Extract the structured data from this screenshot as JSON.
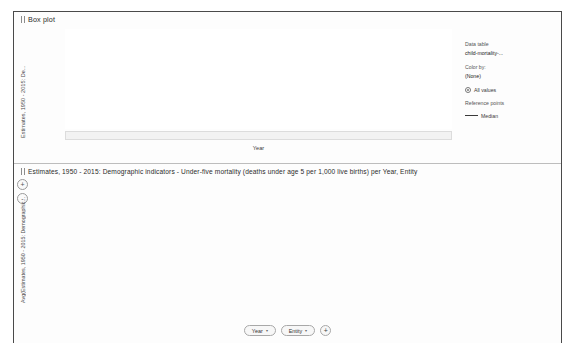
{
  "boxplot": {
    "panel_title": "Box plot",
    "y_axis_label": "Estimates, 1950 - 2015: De...",
    "x_axis_title": "Year",
    "y_ticks": [
      450,
      400,
      350,
      300,
      250,
      200,
      150,
      100,
      50,
      0
    ],
    "x_first_label": "1950",
    "x_last_label": "2015",
    "x_truncated_early": "1",
    "x_truncated_late": "2",
    "legend": {
      "data_table_header": "Data table",
      "data_table_value": "child-mortality-...",
      "color_by_header": "Color by:",
      "color_by_value": "(None)",
      "all_values_label": "All values",
      "reference_points_header": "Reference points",
      "median_label": "Median"
    }
  },
  "barchart": {
    "panel_title": "Estimates, 1950 - 2015: Demographic indicators - Under-five mortality (deaths under age 5 per 1,000 live births) per Year, Entity",
    "y_axis_label": "Avg(Estimates, 1950 - 2015: Demographic...",
    "y_ticks": [
      400,
      300,
      200,
      100,
      0
    ],
    "zoom_in_label": "+",
    "zoom_out_label": "-",
    "footer": {
      "year_button": "Year",
      "entity_button": "Entity",
      "add_button": "+",
      "caret": "▾"
    }
  },
  "chart_data": [
    {
      "type": "box",
      "title": "Box plot",
      "xlabel": "Year",
      "ylabel": "Estimates, 1950 - 2015: De...",
      "ylim": [
        0,
        460
      ],
      "grid": false,
      "legend_position": "right",
      "x": [
        1950,
        1951,
        1952,
        1953,
        1954,
        1955,
        1956,
        1957,
        1958,
        1959,
        1960,
        1961,
        1962,
        1963,
        1964,
        1965,
        1966,
        1967,
        1968,
        1969,
        1970,
        1971,
        1972,
        1973,
        1974,
        1975,
        1976,
        1977,
        1978,
        1979,
        1980,
        1981,
        1982,
        1983,
        1984,
        1985,
        1986,
        1987,
        1988,
        1989,
        1990,
        1991,
        1992,
        1993,
        1994,
        1995,
        1996,
        1997,
        1998,
        1999,
        2000,
        2001,
        2002,
        2003,
        2004,
        2005,
        2006,
        2007,
        2008,
        2009,
        2010,
        2011,
        2012,
        2013,
        2014,
        2015
      ],
      "whisker_high": [
        440,
        438,
        436,
        434,
        432,
        430,
        428,
        426,
        424,
        422,
        420,
        416,
        412,
        408,
        404,
        400,
        396,
        392,
        388,
        384,
        380,
        374,
        368,
        362,
        356,
        350,
        344,
        338,
        332,
        326,
        320,
        313,
        306,
        299,
        292,
        285,
        278,
        271,
        264,
        257,
        250,
        244,
        238,
        232,
        226,
        220,
        214,
        208,
        202,
        196,
        190,
        185,
        180,
        175,
        170,
        166,
        162,
        158,
        154,
        150,
        147,
        144,
        141,
        138,
        135,
        132
      ],
      "q3": [
        270,
        268,
        266,
        264,
        262,
        260,
        258,
        256,
        254,
        252,
        250,
        246,
        243,
        240,
        237,
        234,
        231,
        228,
        225,
        222,
        219,
        214,
        210,
        206,
        202,
        198,
        194,
        190,
        186,
        182,
        178,
        174,
        170,
        166,
        162,
        158,
        154,
        150,
        146,
        142,
        138,
        134,
        130,
        126,
        122,
        118,
        114,
        110,
        106,
        102,
        99,
        96,
        93,
        90,
        87,
        84,
        81,
        78,
        76,
        74,
        72,
        70,
        68,
        66,
        64,
        62
      ],
      "median": [
        215,
        214,
        213,
        212,
        211,
        210,
        209,
        208,
        207,
        206,
        205,
        202,
        199,
        196,
        193,
        190,
        187,
        184,
        181,
        178,
        175,
        171,
        167,
        163,
        159,
        155,
        151,
        147,
        143,
        139,
        135,
        131,
        127,
        123,
        119,
        115,
        111,
        107,
        103,
        99,
        96,
        93,
        90,
        87,
        84,
        81,
        78,
        75,
        72,
        69,
        66,
        64,
        62,
        60,
        58,
        56,
        54,
        52,
        50,
        48,
        46,
        45,
        44,
        43,
        42,
        41
      ],
      "q1": [
        120,
        119,
        118,
        117,
        116,
        115,
        114,
        113,
        112,
        111,
        110,
        108,
        106,
        104,
        102,
        100,
        98,
        96,
        94,
        92,
        90,
        87,
        84,
        81,
        78,
        75,
        72,
        69,
        66,
        63,
        60,
        58,
        56,
        54,
        52,
        50,
        48,
        46,
        44,
        42,
        40,
        38,
        37,
        36,
        35,
        34,
        33,
        32,
        31,
        30,
        29,
        28,
        27,
        26,
        25,
        24,
        23,
        22,
        21,
        20,
        19,
        18,
        18,
        17,
        17,
        16
      ],
      "whisker_low": [
        30,
        30,
        29,
        29,
        28,
        28,
        27,
        27,
        26,
        26,
        25,
        24,
        24,
        23,
        23,
        22,
        22,
        21,
        21,
        20,
        20,
        19,
        19,
        18,
        18,
        17,
        17,
        16,
        16,
        15,
        15,
        14,
        14,
        13,
        13,
        12,
        12,
        11,
        11,
        10,
        10,
        10,
        9,
        9,
        9,
        8,
        8,
        8,
        7,
        7,
        7,
        6,
        6,
        6,
        6,
        5,
        5,
        5,
        5,
        5,
        4,
        4,
        4,
        4,
        4,
        4
      ],
      "outliers": [
        {
          "x": 1972,
          "y": 418
        },
        {
          "x": 1974,
          "y": 430
        },
        {
          "x": 1975,
          "y": 432
        },
        {
          "x": 1977,
          "y": 420
        },
        {
          "x": 1973,
          "y": 355
        },
        {
          "x": 1975,
          "y": 352
        },
        {
          "x": 1976,
          "y": 350
        },
        {
          "x": 1977,
          "y": 355
        },
        {
          "x": 1978,
          "y": 340
        },
        {
          "x": 1980,
          "y": 310
        },
        {
          "x": 1981,
          "y": 310
        },
        {
          "x": 1982,
          "y": 311
        },
        {
          "x": 1983,
          "y": 312
        },
        {
          "x": 1984,
          "y": 313
        },
        {
          "x": 1985,
          "y": 314
        },
        {
          "x": 1986,
          "y": 314
        },
        {
          "x": 1987,
          "y": 313
        },
        {
          "x": 1988,
          "y": 312
        },
        {
          "x": 1989,
          "y": 311
        },
        {
          "x": 1990,
          "y": 308
        },
        {
          "x": 1991,
          "y": 300
        },
        {
          "x": 1992,
          "y": 295
        },
        {
          "x": 1992,
          "y": 350
        },
        {
          "x": 1993,
          "y": 400
        },
        {
          "x": 1994,
          "y": 415
        },
        {
          "x": 1995,
          "y": 418
        },
        {
          "x": 1996,
          "y": 400
        },
        {
          "x": 1997,
          "y": 350
        },
        {
          "x": 1993,
          "y": 290
        },
        {
          "x": 1994,
          "y": 288
        },
        {
          "x": 1995,
          "y": 286
        },
        {
          "x": 1996,
          "y": 284
        },
        {
          "x": 1997,
          "y": 282
        },
        {
          "x": 1998,
          "y": 280
        },
        {
          "x": 1999,
          "y": 270
        },
        {
          "x": 1998,
          "y": 310
        },
        {
          "x": 2000,
          "y": 255
        },
        {
          "x": 2001,
          "y": 250
        },
        {
          "x": 2002,
          "y": 245
        },
        {
          "x": 2003,
          "y": 240
        },
        {
          "x": 2004,
          "y": 232
        },
        {
          "x": 2005,
          "y": 225
        },
        {
          "x": 2006,
          "y": 218
        },
        {
          "x": 2007,
          "y": 210
        },
        {
          "x": 2008,
          "y": 203
        },
        {
          "x": 2009,
          "y": 196
        },
        {
          "x": 2010,
          "y": 190
        },
        {
          "x": 2011,
          "y": 183
        },
        {
          "x": 2012,
          "y": 177
        },
        {
          "x": 2013,
          "y": 171
        },
        {
          "x": 2014,
          "y": 165
        },
        {
          "x": 2015,
          "y": 160
        }
      ]
    },
    {
      "type": "bar",
      "title": "Estimates, 1950 - 2015: Demographic indicators - Under-five mortality (deaths under age 5 per 1,000 live births) per Year, Entity",
      "xlabel": "",
      "ylabel": "Avg(Estimates, 1950 - 2015: Demographic...",
      "ylim": [
        0,
        430
      ],
      "grid": false,
      "bars": [
        {
          "year": "1977",
          "entity": "Cambodia",
          "value": 393
        },
        {
          "year": "1977",
          "entity": "Cambodia",
          "value": 415
        },
        {
          "year": "1978",
          "entity": "Cambodia",
          "value": 355
        },
        {
          "year": "1978",
          "entity": "Cambodia",
          "value": 417
        },
        {
          "year": "1979",
          "entity": "Cambodia",
          "value": 411
        },
        {
          "year": "1979",
          "entity": "Cambodia",
          "value": 357
        },
        {
          "year": "1980",
          "entity": "Cambodia",
          "value": 352
        },
        {
          "year": "1980",
          "entity": "Niger",
          "value": 313
        },
        {
          "year": "1982",
          "entity": "Niger",
          "value": 314
        },
        {
          "year": "1983",
          "entity": "Niger",
          "value": 314
        },
        {
          "year": "1984",
          "entity": "Niger",
          "value": 314
        },
        {
          "year": "1985",
          "entity": "Niger",
          "value": 313
        },
        {
          "year": "1986",
          "entity": "Niger",
          "value": 313
        },
        {
          "year": "1988",
          "entity": "Rwanda",
          "value": 300
        },
        {
          "year": "1989",
          "entity": "Rwanda",
          "value": 324
        },
        {
          "year": "1990",
          "entity": "Rwanda",
          "value": 345
        },
        {
          "year": "1990",
          "entity": "Sierra L...",
          "value": 298
        },
        {
          "year": "1991",
          "entity": "Niger",
          "value": 390
        },
        {
          "year": "1991",
          "entity": "Rwanda",
          "value": 283
        },
        {
          "year": "1992",
          "entity": "Niger",
          "value": 273
        },
        {
          "year": "1992",
          "entity": "Rwanda",
          "value": 415
        },
        {
          "year": "1993",
          "entity": "Sierra L...",
          "value": 268
        },
        {
          "year": "1993",
          "entity": "Rwanda",
          "value": 287
        },
        {
          "year": "1993",
          "entity": "Rwanda",
          "value": 414
        },
        {
          "year": "1994",
          "entity": "Rwanda",
          "value": 277
        },
        {
          "year": "1994",
          "entity": "Angola",
          "value": 267
        },
        {
          "year": "1994",
          "entity": "Niger",
          "value": 400
        },
        {
          "year": "1995",
          "entity": "Angola",
          "value": 240
        },
        {
          "year": "1995",
          "entity": "Niger",
          "value": 245
        },
        {
          "year": "1995",
          "entity": "Sierra L...",
          "value": 238
        },
        {
          "year": "1996",
          "entity": "Mali",
          "value": 287
        },
        {
          "year": "1996",
          "entity": "Rwanda",
          "value": 358
        },
        {
          "year": "1996",
          "entity": "Angola",
          "value": 232
        },
        {
          "year": "1997",
          "entity": "Sierra L...",
          "value": 248
        },
        {
          "year": "1997",
          "entity": "Mali",
          "value": 253
        },
        {
          "year": "1997",
          "entity": "Rwanda",
          "value": 307
        },
        {
          "year": "1997",
          "entity": "Angola",
          "value": 228
        },
        {
          "year": "1998",
          "entity": "Sierra L...",
          "value": 224
        },
        {
          "year": "1998",
          "entity": "Niger",
          "value": 255
        },
        {
          "year": "1998",
          "entity": "Mali",
          "value": 253
        },
        {
          "year": "1998",
          "entity": "Sierra L...",
          "value": 220
        },
        {
          "year": "1999",
          "entity": "Mali",
          "value": 239
        },
        {
          "year": "1999",
          "entity": "Sierra L...",
          "value": 237
        },
        {
          "year": "1999",
          "entity": "Niger",
          "value": 232
        },
        {
          "year": "2000",
          "entity": "Sierra L...",
          "value": 227
        },
        {
          "year": "2000",
          "entity": "Niger",
          "value": 222
        },
        {
          "year": "2001",
          "entity": "Sierra L...",
          "value": 218
        },
        {
          "year": "2001",
          "entity": "Niger",
          "value": 212
        },
        {
          "year": "2002",
          "entity": "Sierra L...",
          "value": 208
        },
        {
          "year": "2002",
          "entity": "Niger",
          "value": 203
        },
        {
          "year": "2003",
          "entity": "Central...",
          "value": 186
        },
        {
          "year": "2003",
          "entity": "Niger",
          "value": 190
        },
        {
          "year": "2003",
          "entity": "Sierra L...",
          "value": 198
        },
        {
          "year": "2004",
          "entity": "Central...",
          "value": 182
        },
        {
          "year": "2004",
          "entity": "Mali",
          "value": 185
        },
        {
          "year": "2004",
          "entity": "Sierra L...",
          "value": 190
        },
        {
          "year": "2005",
          "entity": "Sierra L...",
          "value": 180
        },
        {
          "year": "2005",
          "entity": "Chad",
          "value": 182
        },
        {
          "year": "2005",
          "entity": "Niger",
          "value": 190
        },
        {
          "year": "2006",
          "entity": "Central...",
          "value": 176
        },
        {
          "year": "2006",
          "entity": "Mali",
          "value": 178
        },
        {
          "year": "2006",
          "entity": "Chad",
          "value": 182
        },
        {
          "year": "2007",
          "entity": "Central...",
          "value": 170
        },
        {
          "year": "2007",
          "entity": "Mali",
          "value": 172
        },
        {
          "year": "2007",
          "entity": "Chad",
          "value": 178
        },
        {
          "year": "2008",
          "entity": "Central...",
          "value": 166
        },
        {
          "year": "2008",
          "entity": "Sierra L...",
          "value": 170
        },
        {
          "year": "2008",
          "entity": "Chad",
          "value": 172
        },
        {
          "year": "2009",
          "entity": "Sierra L...",
          "value": 162
        },
        {
          "year": "2009",
          "entity": "Chad",
          "value": 168
        },
        {
          "year": "2010",
          "entity": "Sierra L...",
          "value": 156
        },
        {
          "year": "2010",
          "entity": "Central...",
          "value": 152
        },
        {
          "year": "2010",
          "entity": "Guinea...",
          "value": 150
        },
        {
          "year": "2011",
          "entity": "Somalia",
          "value": 155
        },
        {
          "year": "2011",
          "entity": "Chad",
          "value": 153
        },
        {
          "year": "2012",
          "entity": "Somalia",
          "value": 150
        },
        {
          "year": "2012",
          "entity": "Chad",
          "value": 148
        },
        {
          "year": "2013",
          "entity": "Somalia",
          "value": 146
        },
        {
          "year": "2013",
          "entity": "Chad",
          "value": 144
        },
        {
          "year": "2014",
          "entity": "Somalia",
          "value": 142
        },
        {
          "year": "2014",
          "entity": "Sierra L...",
          "value": 130
        },
        {
          "year": "2015",
          "entity": "Burundi",
          "value": 138
        },
        {
          "year": "2015",
          "entity": "Guinea",
          "value": 122
        }
      ]
    }
  ]
}
